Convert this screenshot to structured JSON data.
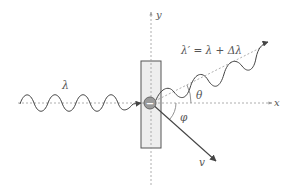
{
  "diagram": {
    "labels": {
      "y_axis": "y",
      "x_axis": "x",
      "incident_wavelength": "λ",
      "scattered_wavelength": "λ′ = λ + Δλ",
      "photon_angle": "θ",
      "electron_angle": "φ",
      "electron_velocity": "v",
      "electron_charge": "−"
    },
    "colors": {
      "line": "#444444",
      "axis": "#999999",
      "slab_fill": "#eeeeee",
      "slab_stroke": "#555555",
      "electron_fill": "#9a9a9a"
    }
  }
}
